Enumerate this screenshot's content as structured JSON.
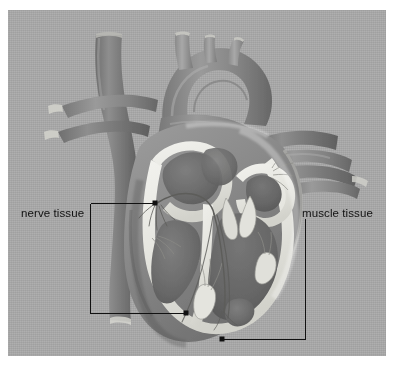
{
  "figure": {
    "name": "heart-cross-section-diagram",
    "background_color": "#ffffff",
    "panel_color": "#a9a9a9",
    "ink_color": "#111111",
    "style": "grayscale anatomical illustration"
  },
  "labels": {
    "nerve": {
      "text": "nerve tissue",
      "side": "left"
    },
    "muscle": {
      "text": "muscle tissue",
      "side": "right"
    }
  },
  "leaders": {
    "nerve": {
      "bracket_x": 90,
      "bracket_top_y": 203,
      "bracket_bottom_y": 313,
      "points": [
        {
          "x": 155,
          "y": 203
        },
        {
          "x": 186,
          "y": 313
        }
      ]
    },
    "muscle": {
      "bracket_x": 305,
      "bracket_top_y": 218,
      "bracket_bottom_y": 339,
      "points": [
        {
          "x": 222,
          "y": 339
        }
      ]
    }
  },
  "anatomy": {
    "structures": [
      "aortic arch",
      "brachiocephalic trunk",
      "left common carotid artery",
      "left subclavian artery",
      "superior vena cava",
      "pulmonary artery",
      "pulmonary veins",
      "right atrium",
      "left atrium",
      "right ventricle",
      "left ventricle",
      "interventricular septum",
      "atrioventricular valves",
      "papillary muscles",
      "chordae tendineae",
      "conduction fibres"
    ]
  }
}
